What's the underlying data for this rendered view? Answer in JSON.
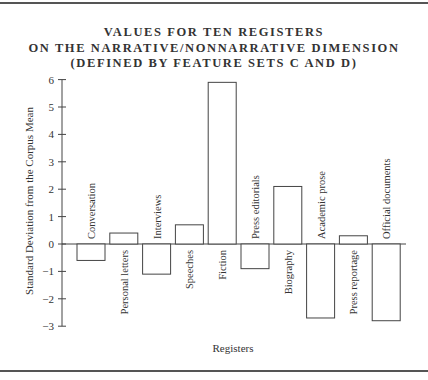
{
  "chart_data": {
    "type": "bar",
    "title": "VALUES FOR TEN REGISTERS ON THE NARRATIVE/NONNARRATIVE DIMENSION (DEFINED BY FEATURE SETS C AND D)",
    "title_lines": [
      "VALUES FOR TEN REGISTERS",
      "ON THE NARRATIVE/NONNARRATIVE DIMENSION",
      "(DEFINED BY FEATURE SETS C AND D)"
    ],
    "xlabel": "Registers",
    "ylabel": "Standard Deviation from the Corpus Mean",
    "ylim": [
      -3,
      6
    ],
    "yticks": [
      -3,
      -2,
      -1,
      0,
      1,
      2,
      3,
      4,
      5,
      6
    ],
    "grid": false,
    "legend": null,
    "categories": [
      "Conversation",
      "Personal letters",
      "Interviews",
      "Speeches",
      "Fiction",
      "Press editorials",
      "Biography",
      "Academic prose",
      "Press reportage",
      "Official documents"
    ],
    "values": [
      -0.6,
      0.4,
      -1.1,
      0.7,
      5.9,
      -0.9,
      2.1,
      -2.7,
      0.3,
      -2.8
    ]
  }
}
